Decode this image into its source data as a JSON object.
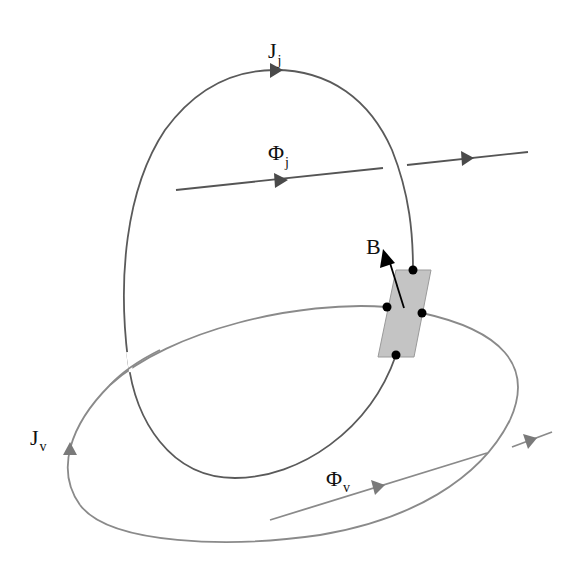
{
  "diagram": {
    "type": "linked current loops with flux and magnetic field",
    "colors": {
      "background": "#ffffff",
      "loop_vertical": "#5a5a5a",
      "loop_horizontal": "#8a8a8a",
      "flux_line_j": "#555555",
      "flux_line_v": "#8a8a8a",
      "arrowhead_dark": "#4a4a4a",
      "arrowhead_light": "#7a7a7a",
      "junction_fill": "#c4c4c4",
      "junction_stroke": "#9a9a9a",
      "dots": "#000000",
      "b_vector": "#000000",
      "text": "#111111"
    },
    "labels": {
      "current_j": {
        "main": "J",
        "sub": "j"
      },
      "flux_j": {
        "main": "Φ",
        "sub": "j"
      },
      "field_b": {
        "main": "B"
      },
      "current_v": {
        "main": "J",
        "sub": "v"
      },
      "flux_v": {
        "main": "Φ",
        "sub": "v"
      }
    },
    "elements": {
      "vertical_loop": "Current loop J_j (vertical ellipse)",
      "horizontal_loop": "Current loop J_v (horizontal ellipse)",
      "flux_j_line": "Flux line Φ_j passing through vertical loop",
      "flux_v_line": "Flux line Φ_v passing through horizontal loop",
      "junction": "Gray parallelogram junction where loops meet",
      "b_arrow": "Magnetic field vector B at junction",
      "junction_dots": 4
    }
  }
}
